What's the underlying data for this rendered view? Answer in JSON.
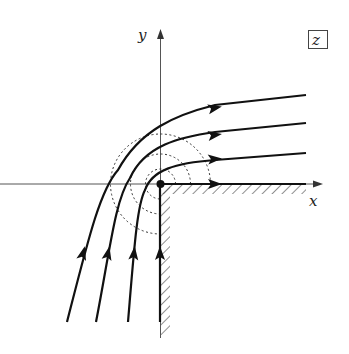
{
  "diagram": {
    "plane_label": "z",
    "axes": {
      "x_label": "x",
      "y_label": "y"
    },
    "colors": {
      "stroke": "#111111",
      "axis": "#555555",
      "dotted": "#333333",
      "background": "#ffffff"
    },
    "streamlines": [
      {
        "id": "s1",
        "path": "M67,322 C88,240 100,190 118,170 C140,130 175,115 215,105 L306,95",
        "arrows": [
          [
            83,
            253,
            -75
          ],
          [
            215,
            108,
            -12
          ]
        ]
      },
      {
        "id": "s2",
        "path": "M96,322 C110,250 115,200 130,178 C145,145 180,137 215,132 L306,123",
        "arrows": [
          [
            108,
            253,
            -78
          ],
          [
            215,
            135,
            -8
          ]
        ]
      },
      {
        "id": "s3",
        "path": "M128,322 C134,250 137,205 145,190 C152,170 175,163 215,160 L306,153",
        "arrows": [
          [
            134,
            253,
            -84
          ],
          [
            215,
            159,
            -4
          ]
        ]
      },
      {
        "id": "s4",
        "path": "M160,322 L160,184 L306,184",
        "arrows": [
          [
            160,
            253,
            -90
          ],
          [
            215,
            184,
            0
          ]
        ]
      }
    ],
    "equipotentials": [
      {
        "r": 15
      },
      {
        "r": 30
      },
      {
        "r": 50
      }
    ],
    "origin": {
      "x": 160,
      "y": 184
    },
    "wall": {
      "horizontal_end_x": 306,
      "vertical_end_y": 338
    }
  }
}
